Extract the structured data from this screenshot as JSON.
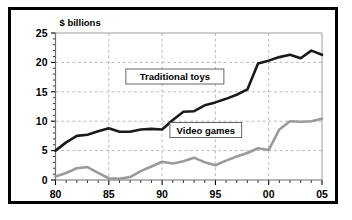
{
  "chart_data": {
    "type": "line",
    "title": "",
    "ylabel": "$ billions",
    "xlabel": "",
    "xlim": [
      80,
      105
    ],
    "ylim": [
      0,
      25
    ],
    "y_ticks": [
      0,
      5,
      10,
      15,
      20,
      25
    ],
    "y_minor_step": 1,
    "x_ticks": [
      80,
      85,
      90,
      95,
      100,
      105
    ],
    "x_tick_labels": [
      "80",
      "85",
      "90",
      "95",
      "00",
      "05"
    ],
    "x_minor_step": 1,
    "grid": "dashed-gray",
    "legend_position": "inline-boxed-labels",
    "x": [
      1980,
      1981,
      1982,
      1983,
      1984,
      1985,
      1986,
      1987,
      1988,
      1989,
      1990,
      1991,
      1992,
      1993,
      1994,
      1995,
      1996,
      1997,
      1998,
      1999,
      2000,
      2001,
      2002,
      2003,
      2004,
      2005
    ],
    "series": [
      {
        "name": "Traditional toys",
        "color": "#1a1a1a",
        "width": 2.6,
        "label_x": 1991.2,
        "label_y": 17.6,
        "values": [
          5.0,
          6.4,
          7.5,
          7.7,
          8.3,
          8.8,
          8.2,
          8.2,
          8.6,
          8.7,
          8.6,
          10.2,
          11.6,
          11.7,
          12.7,
          13.2,
          13.8,
          14.5,
          15.4,
          19.8,
          20.3,
          20.9,
          21.3,
          20.7,
          22.0,
          21.3
        ]
      },
      {
        "name": "Video games",
        "color": "#9a9a9a",
        "width": 2.6,
        "label_x": 1994.1,
        "label_y": 8.5,
        "values": [
          0.6,
          1.2,
          2.0,
          2.2,
          1.2,
          0.3,
          0.2,
          0.5,
          1.5,
          2.3,
          3.1,
          2.8,
          3.2,
          3.8,
          3.0,
          2.5,
          3.3,
          4.0,
          4.6,
          5.4,
          5.1,
          8.6,
          10.0,
          9.9,
          10.0,
          10.4
        ]
      }
    ]
  },
  "axis": {
    "y_title": "$ billions",
    "y_tick_labels": [
      "0",
      "5",
      "10",
      "15",
      "20",
      "25"
    ],
    "x_tick_labels": [
      "80",
      "85",
      "90",
      "95",
      "00",
      "05"
    ]
  },
  "labels": {
    "traditional": "Traditional toys",
    "video": "Video games"
  }
}
